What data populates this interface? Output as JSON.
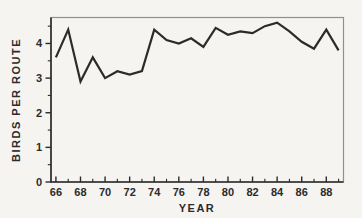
{
  "figure": {
    "background_color": "#f5f4f1",
    "ink_color": "#2b2b2b",
    "frame_color": "#8f8f8f"
  },
  "chart_data": {
    "type": "line",
    "title": "",
    "xlabel": "YEAR",
    "ylabel": "BIRDS PER ROUTE",
    "x": [
      66,
      67,
      68,
      69,
      70,
      71,
      72,
      73,
      74,
      75,
      76,
      77,
      78,
      79,
      80,
      81,
      82,
      83,
      84,
      85,
      86,
      87,
      88,
      89
    ],
    "values": [
      3.6,
      4.4,
      2.9,
      3.6,
      3.0,
      3.2,
      3.1,
      3.2,
      4.4,
      4.1,
      4.0,
      4.15,
      3.9,
      4.45,
      4.25,
      4.35,
      4.3,
      4.5,
      4.6,
      4.35,
      4.05,
      3.85,
      4.4,
      3.8
    ],
    "xlim": [
      65.6,
      89.4
    ],
    "ylim": [
      0,
      4.75
    ],
    "x_major_ticks": [
      66,
      68,
      70,
      72,
      74,
      76,
      78,
      80,
      82,
      84,
      86,
      88
    ],
    "x_minor_ticks": [
      67,
      69,
      71,
      73,
      75,
      77,
      79,
      81,
      83,
      85,
      87,
      89
    ],
    "y_major_ticks": [
      0,
      1,
      2,
      3,
      4
    ],
    "y_minor_ticks": [
      0.5,
      1.5,
      2.5,
      3.5,
      4.5
    ],
    "grid": false,
    "legend": "none",
    "line_color": "#2b2b2b",
    "line_width": 2.2
  }
}
